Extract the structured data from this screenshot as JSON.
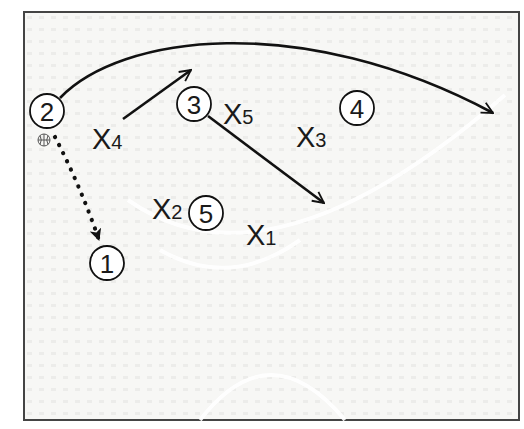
{
  "diagram": {
    "type": "basketball-play",
    "background_color": "#f6f6f4",
    "border_color": "#444444",
    "ink_color": "#111111",
    "offense_players": [
      {
        "label": "1",
        "cx": 107,
        "cy": 263
      },
      {
        "label": "2",
        "cx": 47,
        "cy": 111,
        "has_ball": true
      },
      {
        "label": "3",
        "cx": 194,
        "cy": 104
      },
      {
        "label": "4",
        "cx": 357,
        "cy": 108
      },
      {
        "label": "5",
        "cx": 206,
        "cy": 213
      }
    ],
    "defense_players": [
      {
        "letter": "X",
        "sub": "1",
        "x": 246,
        "y": 245
      },
      {
        "letter": "X",
        "sub": "2",
        "x": 152,
        "y": 219
      },
      {
        "letter": "X",
        "sub": "3",
        "x": 296,
        "y": 147
      },
      {
        "letter": "X",
        "sub": "4",
        "x": 92,
        "y": 149
      },
      {
        "letter": "X",
        "sub": "5",
        "x": 223,
        "y": 124
      }
    ],
    "movements": [
      {
        "from": "2",
        "type": "cut",
        "style": "solid-curved",
        "description": "Player 2 cuts across the top toward the right side"
      },
      {
        "from": "X4",
        "type": "cut",
        "style": "solid",
        "description": "Arrow from X4 toward upper right"
      },
      {
        "from": "3",
        "type": "cut",
        "style": "solid",
        "description": "Player 3 cuts diagonally down-right"
      },
      {
        "from": "2",
        "to": "1",
        "type": "pass",
        "style": "dotted",
        "description": "Pass from 2 to 1"
      }
    ],
    "ball_icon": "basketball-icon"
  }
}
